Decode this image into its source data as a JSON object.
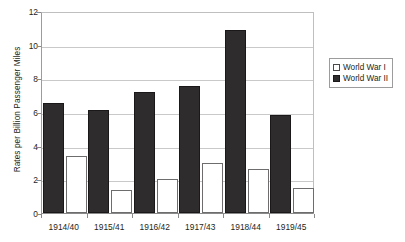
{
  "chart_data": {
    "type": "bar",
    "title": "",
    "xlabel": "",
    "ylabel": "Rates per Billion Passenger Miles",
    "ylim": [
      0,
      12
    ],
    "yticks": [
      "0",
      "2",
      "4",
      "6",
      "8",
      "10",
      "12"
    ],
    "grid": true,
    "legend_position": "right",
    "categories": [
      "1914/40",
      "1915/41",
      "1916/42",
      "1917/43",
      "1918/44",
      "1919/45"
    ],
    "series": [
      {
        "name": "World War I",
        "color": "#ffffff",
        "values": [
          3.4,
          1.37,
          2.05,
          2.97,
          2.6,
          1.5
        ]
      },
      {
        "name": "World War II",
        "color": "#2e2c2d",
        "values": [
          6.55,
          6.1,
          7.2,
          7.55,
          10.9,
          5.85
        ]
      }
    ]
  },
  "legend": {
    "entries": [
      {
        "label": "World War I",
        "swatch": "hollow-square-swatch"
      },
      {
        "label": "World War II",
        "swatch": "filled-square-swatch"
      }
    ]
  },
  "axes": {
    "y_title": "Rates per Billion Passenger Miles"
  }
}
